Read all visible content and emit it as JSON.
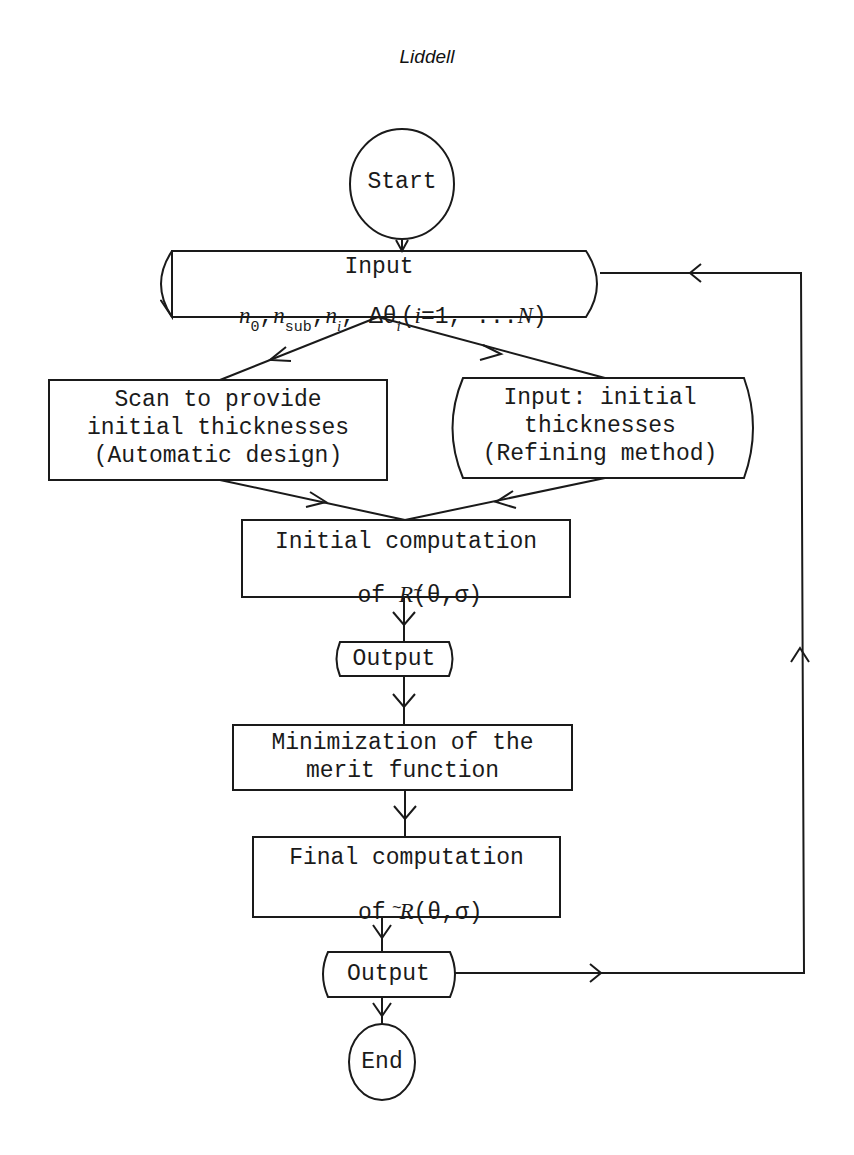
{
  "header": {
    "author": "Liddell"
  },
  "flowchart": {
    "start": {
      "label": "Start"
    },
    "input": {
      "title": "Input",
      "params": {
        "n0": "n",
        "n0_sub": "0",
        "nsub": "n",
        "nsub_sub": "sub",
        "ni": "n",
        "ni_sub": "i",
        "dtheta": "Δθ",
        "dtheta_sub": "i",
        "range_open": "(",
        "range_i": "i",
        "range_rest": "=1, ...",
        "range_N": "N",
        "range_close": ")"
      }
    },
    "scan_box": {
      "lines": [
        "Scan to provide",
        "initial thicknesses",
        "(Automatic design)"
      ]
    },
    "input_initial_box": {
      "lines": [
        "Input: initial",
        "thicknesses",
        "(Refining method)"
      ]
    },
    "initial_computation": {
      "line1": "Initial computation",
      "line2_prefix": "of ",
      "line2_R": "R",
      "line2_args": "(θ,σ)",
      "tilde": "~"
    },
    "output1": {
      "label": "Output"
    },
    "minimization": {
      "lines": [
        "Minimization of the",
        "merit function"
      ]
    },
    "final_computation": {
      "line1": "Final computation",
      "line2_prefix": "of ",
      "line2_R": "R",
      "line2_args": "(θ,σ)",
      "tilde": "~"
    },
    "output2": {
      "label": "Output"
    },
    "end": {
      "label": "End"
    }
  },
  "colors": {
    "ink": "#1a1a1a",
    "background": "#ffffff"
  }
}
